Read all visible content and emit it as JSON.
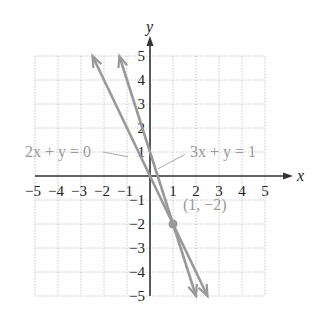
{
  "chart_data": {
    "type": "line",
    "title": "",
    "xlabel": "x",
    "ylabel": "y",
    "xlim": [
      -5,
      5
    ],
    "ylim": [
      -5,
      5
    ],
    "grid": true,
    "x_ticks": [
      "−5",
      "−4",
      "−3",
      "−2",
      "−1",
      "1",
      "2",
      "3",
      "4",
      "5"
    ],
    "y_ticks": [
      "5",
      "4",
      "3",
      "2",
      "1",
      "−1",
      "−2",
      "−3",
      "−4",
      "−5"
    ],
    "series": [
      {
        "name": "2x + y = 0",
        "equation": "y = -2x",
        "points": [
          [
            -2.5,
            5
          ],
          [
            2.5,
            -5
          ]
        ],
        "color": "#999999"
      },
      {
        "name": "3x + y = 1",
        "equation": "y = 1 - 3x",
        "points": [
          [
            -1.333,
            5
          ],
          [
            2,
            -5
          ]
        ],
        "color": "#999999"
      }
    ],
    "annotations": [
      {
        "text": "2x + y = 0",
        "target": [
          -0.3,
          0.6
        ]
      },
      {
        "text": "3x + y = 1",
        "target": [
          0.15,
          0.55
        ]
      },
      {
        "text": "(1, −2)",
        "point": [
          1,
          -2
        ]
      }
    ],
    "intersection": {
      "x": 1,
      "y": -2,
      "label": "(1, −2)"
    }
  },
  "labels": {
    "x_axis": "x",
    "y_axis": "y",
    "eq1": "2x + y = 0",
    "eq2": "3x + y = 1",
    "point": "(1, −2)"
  }
}
